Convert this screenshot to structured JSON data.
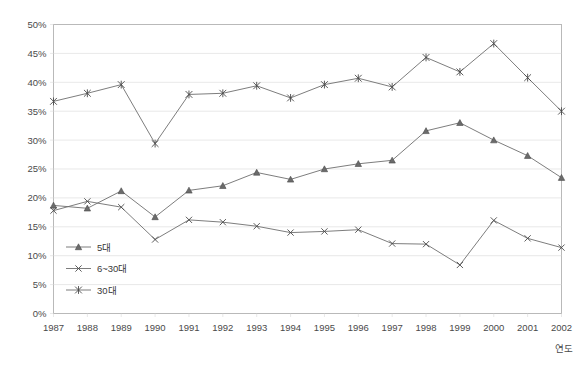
{
  "chart_data": {
    "type": "line",
    "title": "",
    "xlabel": "연도",
    "ylabel": "",
    "grid": true,
    "legend_position": "inside-bottom-left",
    "xlim": [
      1987,
      2002
    ],
    "ylim": [
      0,
      50
    ],
    "ytick_labels": [
      "0%",
      "5%",
      "10%",
      "15%",
      "20%",
      "25%",
      "30%",
      "35%",
      "40%",
      "45%",
      "50%"
    ],
    "ytick_values": [
      0,
      5,
      10,
      15,
      20,
      25,
      30,
      35,
      40,
      45,
      50
    ],
    "categories": [
      "1987",
      "1988",
      "1989",
      "1990",
      "1991",
      "1992",
      "1993",
      "1994",
      "1995",
      "1996",
      "1997",
      "1998",
      "1999",
      "2000",
      "2001",
      "2002"
    ],
    "series": [
      {
        "name": "5대",
        "marker": "triangle",
        "values": [
          18.7,
          18.2,
          21.2,
          16.7,
          21.3,
          22.1,
          24.4,
          23.2,
          25.0,
          25.9,
          26.5,
          31.6,
          33.0,
          30.0,
          27.3,
          23.5
        ]
      },
      {
        "name": "6~30대",
        "marker": "x",
        "values": [
          17.8,
          19.4,
          18.4,
          12.8,
          16.2,
          15.8,
          15.1,
          14.0,
          14.2,
          14.5,
          12.1,
          12.0,
          8.4,
          16.1,
          13.0,
          11.4
        ]
      },
      {
        "name": "30대",
        "marker": "asterisk",
        "values": [
          36.7,
          38.1,
          39.6,
          29.4,
          37.9,
          38.1,
          39.4,
          37.3,
          39.6,
          40.7,
          39.2,
          44.3,
          41.8,
          46.7,
          40.8,
          35.0
        ]
      }
    ],
    "colors": {
      "line": "#6e6e6e",
      "marker": "#4a4a4a",
      "grid": "#d9d9d9",
      "frame": "#b9b9b9",
      "background": "#ffffff"
    }
  },
  "legend": {
    "items": [
      {
        "label": "5대"
      },
      {
        "label": "6~30대"
      },
      {
        "label": "30대"
      }
    ]
  }
}
